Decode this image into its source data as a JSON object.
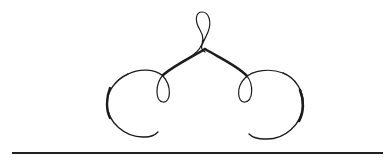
{
  "ornament": {
    "type": "calligraphic-flourish",
    "symmetry": "mirrored-horizontal",
    "ink_color": "#1c1c1c",
    "background_color": "#ffffff"
  },
  "rule": {
    "color": "#222222"
  }
}
